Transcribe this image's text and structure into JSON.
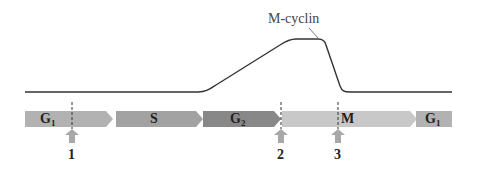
{
  "curve": {
    "label": "M-cyclin",
    "color": "#333333"
  },
  "phases": [
    {
      "name": "G",
      "sub": "1",
      "color": "#b2b2b2"
    },
    {
      "name": "S",
      "sub": "",
      "color": "#a2a2a2"
    },
    {
      "name": "G",
      "sub": "2",
      "color": "#888888"
    },
    {
      "name": "M",
      "sub": "",
      "color": "#c8c8c8"
    },
    {
      "name": "G",
      "sub": "1",
      "color": "#b2b2b2"
    }
  ],
  "checkpoints": [
    {
      "label": "1"
    },
    {
      "label": "2"
    },
    {
      "label": "3"
    }
  ],
  "colors": {
    "checkpoint_arrow": "#a8a8a8",
    "dashed_line": "#333333"
  }
}
